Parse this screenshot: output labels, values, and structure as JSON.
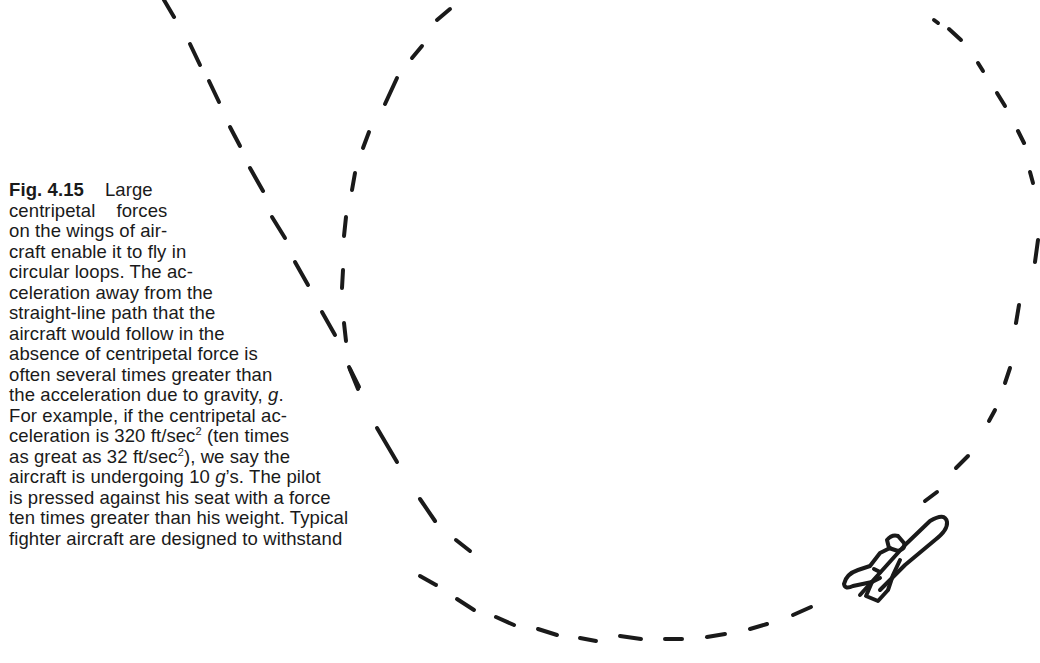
{
  "figure": {
    "label": "Fig. 4.15",
    "caption_lines": [
      {
        "label": "Fig. 4.15",
        "text": "Large"
      },
      {
        "text": "centripetal    forces"
      },
      {
        "text": "on the wings of air-"
      },
      {
        "text": "craft enable it to fly in"
      },
      {
        "text": "circular loops. The ac-"
      },
      {
        "text": "celeration away from the"
      },
      {
        "text": "straight-line path that the"
      },
      {
        "text": "aircraft would follow in the"
      },
      {
        "text": "absence of centripetal force is"
      },
      {
        "text": "often several times greater than"
      },
      {
        "pre": "the acceleration due to gravity, ",
        "italic": "g",
        "post": "."
      },
      {
        "text": "For example, if the centripetal ac-"
      },
      {
        "pre": "celeration is 320 ft/sec",
        "sup": "2",
        "post": " (ten times"
      },
      {
        "pre": "as great as 32 ft/sec",
        "sup": "2",
        "post": "), we say the"
      },
      {
        "pre": "aircraft is undergoing 10 ",
        "italic": "g",
        "post": "’s. The pilot"
      },
      {
        "text": "is pressed against his seat with a force"
      },
      {
        "text": "ten times greater than his weight. Typical"
      },
      {
        "text": "fighter aircraft are designed to withstand"
      }
    ],
    "illustration": {
      "description": "dashed circular loop path with dashed straight-line tangent path and a small aircraft on the loop",
      "stroke_color": "#1a1a1a",
      "aircraft_icon": "airplane-icon"
    }
  }
}
